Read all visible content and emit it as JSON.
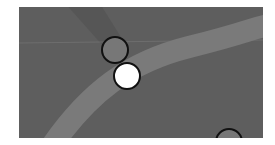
{
  "map": {
    "background_color": "#5e5e5e",
    "road_color": "#7a7a7a",
    "shadow_band_color": "#565656",
    "grid_line_color": "#8a8a8a",
    "markers": [
      {
        "name": "marker-grey",
        "cx": 96,
        "cy": 43,
        "r": 13,
        "fill": "#777777",
        "stroke": "#111111"
      },
      {
        "name": "marker-selected-white",
        "cx": 108,
        "cy": 69,
        "r": 13,
        "fill": "#ffffff",
        "stroke": "#111111"
      },
      {
        "name": "marker-partial-bottom",
        "cx": 210,
        "cy": 135,
        "r": 13,
        "fill": "#777777",
        "stroke": "#111111"
      }
    ]
  }
}
